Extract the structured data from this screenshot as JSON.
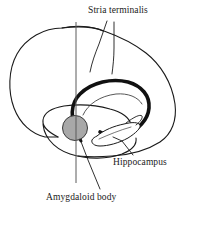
{
  "figure": {
    "type": "anatomical-diagram",
    "width": 200,
    "height": 231,
    "background_color": "#ffffff",
    "outline_color": "#1a1a1a",
    "amygdala_fill_color": "#a8a8a8",
    "labels": [
      {
        "id": "stria-terminalis",
        "text": "Stria terminalis",
        "x": 88,
        "y": 5
      },
      {
        "id": "hippocampus",
        "text": "Hippocampus",
        "x": 113,
        "y": 157
      },
      {
        "id": "amygdaloid-body",
        "text": "Amygdaloid body",
        "x": 46,
        "y": 192
      }
    ],
    "structures": [
      {
        "id": "cerebrum-outline",
        "name": "Cerebral hemisphere outline"
      },
      {
        "id": "temporal-lobe",
        "name": "Temporal lobe outline"
      },
      {
        "id": "stria-loop",
        "name": "Stria terminalis / fornix loop"
      },
      {
        "id": "hippocampus-body",
        "name": "Hippocampus"
      },
      {
        "id": "amygdaloid-body",
        "name": "Amygdaloid body"
      },
      {
        "id": "reference-axis",
        "name": "Vertical reference axis"
      }
    ]
  }
}
